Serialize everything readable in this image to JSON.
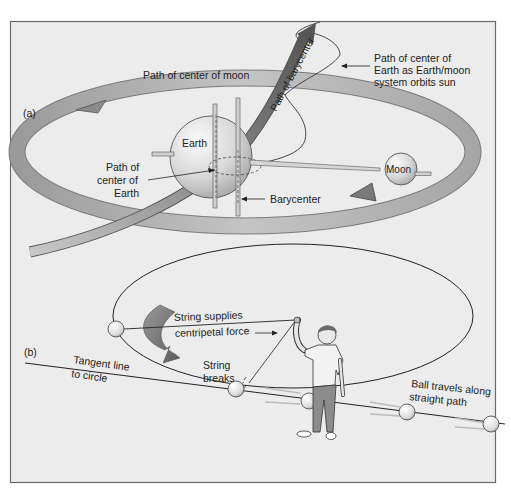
{
  "figure": {
    "background": "#ffffff",
    "panel_fill": "#ececec",
    "frame_color": "#6a6a6a",
    "arrow_dark": "#6e6e6e",
    "arrow_light": "#bdbdbd",
    "panels": [
      {
        "label": "(a)",
        "labels": {
          "path_center_moon": "Path of center of moon",
          "path_barycenter": "Path of barycenter",
          "path_center_earth_sun_line1": "Path of center of",
          "path_center_earth_sun_line2": "Earth as Earth/moon",
          "path_center_earth_sun_line3": "system orbits sun",
          "earth": "Earth",
          "moon": "Moon",
          "path_center_earth_line1": "Path of",
          "path_center_earth_line2": "center of",
          "path_center_earth_line3": "Earth",
          "barycenter": "Barycenter"
        }
      },
      {
        "label": "(b)",
        "labels": {
          "string_supplies": "String supplies",
          "centripetal_force": "centripetal force",
          "tangent_line_1": "Tangent line",
          "tangent_line_2": "to circle",
          "string_breaks_1": "String",
          "string_breaks_2": "breaks",
          "ball_travels_1": "Ball travels along",
          "ball_travels_2": "straight path"
        }
      }
    ]
  }
}
